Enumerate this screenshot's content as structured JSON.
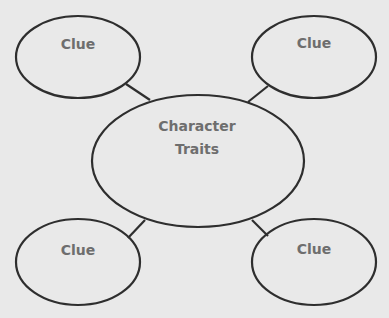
{
  "diagram": {
    "center": {
      "line1": "Character",
      "line2": "Traits"
    },
    "clues": [
      {
        "label": "Clue"
      },
      {
        "label": "Clue"
      },
      {
        "label": "Clue"
      },
      {
        "label": "Clue"
      }
    ]
  }
}
